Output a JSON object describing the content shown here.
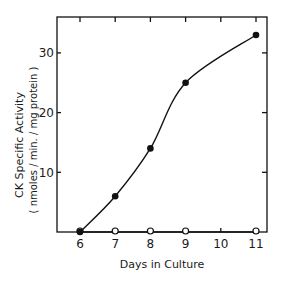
{
  "chart_data": {
    "type": "line",
    "title": "",
    "xlabel": "Days in Culture",
    "ylabel": "CK Specific Activity",
    "ylabel_units": "( nmoles / min. / mg protein )",
    "x_ticks": [
      6,
      7,
      8,
      9,
      10,
      11
    ],
    "x_tick_labels": [
      "6",
      "7",
      "8",
      "9",
      "10",
      "11"
    ],
    "y_ticks": [
      10,
      20,
      30
    ],
    "y_tick_labels": [
      "10",
      "20",
      "30"
    ],
    "xlim": [
      5.35,
      11.3
    ],
    "ylim": [
      0,
      36
    ],
    "grid": false,
    "legend": null,
    "series": [
      {
        "name": "filled circles",
        "marker": "filled-circle",
        "line": "smooth",
        "x": [
          6,
          7,
          8,
          9,
          11
        ],
        "y": [
          0,
          6,
          14,
          25,
          33
        ]
      },
      {
        "name": "open circles",
        "marker": "open-circle",
        "line": "straight",
        "x": [
          6,
          7,
          8,
          9,
          11
        ],
        "y": [
          0,
          0,
          0,
          0,
          0
        ]
      }
    ]
  }
}
